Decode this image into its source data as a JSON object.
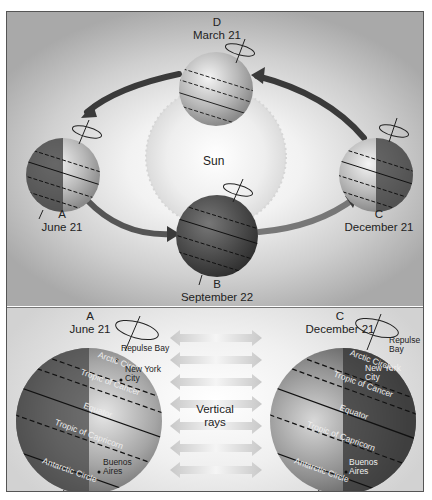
{
  "orbit_diagram": {
    "sun_label": "Sun",
    "positions": [
      {
        "letter": "D",
        "date": "March 21"
      },
      {
        "letter": "A",
        "date": "June 21"
      },
      {
        "letter": "B",
        "date": "September 22"
      },
      {
        "letter": "C",
        "date": "December 21"
      }
    ]
  },
  "closeups": {
    "left": {
      "letter": "A",
      "date": "June 21",
      "latitudes": [
        "Arctic Circle",
        "Tropic of Cancer",
        "Equator",
        "Tropic of Capricorn",
        "Antarctic Circle"
      ],
      "cities": [
        "Repulse Bay",
        "New York City",
        "Buenos Aires"
      ]
    },
    "right": {
      "letter": "C",
      "date": "December 21",
      "latitudes": [
        "Arctic Circle",
        "Tropic of Cancer",
        "Equator",
        "Tropic of Capricorn",
        "Antarctic Circle"
      ],
      "cities": [
        "Repulse Bay",
        "New York City",
        "Buenos Aires"
      ]
    },
    "center_label_line1": "Vertical",
    "center_label_line2": "rays"
  },
  "colors": {
    "earth_light": "#c8c8c8",
    "earth_dark": "#4a4a4a",
    "arrow": "#3a3a3a",
    "ray_arrow": "#cfcfcf"
  }
}
